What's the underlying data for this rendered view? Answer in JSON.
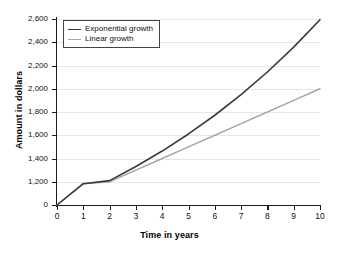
{
  "chart_data": {
    "type": "line",
    "title": "",
    "xlabel": "Time in years",
    "ylabel": "Amount in dollars",
    "x": [
      0,
      1,
      2,
      3,
      4,
      5,
      6,
      7,
      8,
      9,
      10
    ],
    "xtick_labels": [
      "0",
      "1",
      "2",
      "3",
      "4",
      "5",
      "6",
      "7",
      "8",
      "9",
      "10"
    ],
    "xlim": [
      0,
      10
    ],
    "ytick_labels": [
      "0",
      "1,200",
      "1,400",
      "1,600",
      "1,800",
      "2,000",
      "2,200",
      "2,400",
      "2,600"
    ],
    "ytick_values": [
      0,
      1200,
      1400,
      1600,
      1800,
      2000,
      2200,
      2400,
      2600
    ],
    "ylim": [
      0,
      2600
    ],
    "axis_break": true,
    "axis_break_note": "y-axis jumps from 0 to 1,200",
    "grid": "horizontal",
    "legend_position": "top-left",
    "series": [
      {
        "name": "Exponential growth",
        "color": "#3a3a3a",
        "values": [
          1000,
          1100,
          1210,
          1331,
          1464,
          1611,
          1772,
          1949,
          2144,
          2358,
          2594
        ]
      },
      {
        "name": "Linear growth",
        "color": "#a6a6a6",
        "values": [
          1000,
          1100,
          1200,
          1300,
          1400,
          1500,
          1600,
          1700,
          1800,
          1900,
          2000
        ]
      }
    ]
  },
  "legend": {
    "items": [
      {
        "label": "Exponential growth"
      },
      {
        "label": "Linear growth"
      }
    ]
  },
  "colors": {
    "exponential": "#3a3a3a",
    "linear": "#a6a6a6",
    "axis": "#1a1a1a",
    "grid": "#e6e6e6",
    "background": "#ffffff"
  }
}
